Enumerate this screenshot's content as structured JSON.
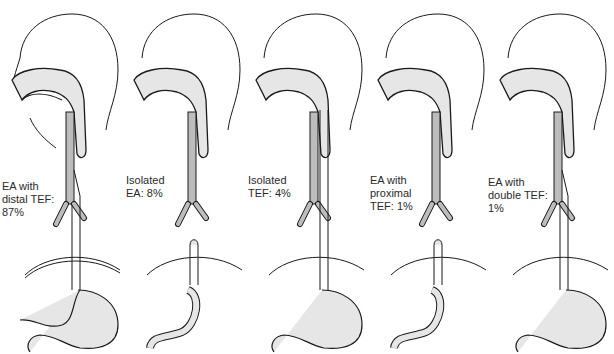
{
  "figure": {
    "colors": {
      "outline": "#1a1a1a",
      "fill": "#e6e6e6",
      "trachea_fill": "#bdbdbd",
      "text": "#2a2a2a"
    },
    "panels": [
      {
        "id": "ea-distal-tef",
        "label": "EA with\ndistal TEF:\n87%",
        "upper_pouch": "blind",
        "lower_connection": "fistula-to-trachea",
        "stomach": "normal"
      },
      {
        "id": "isolated-ea",
        "label": "Isolated\nEA: 8%",
        "upper_pouch": "blind",
        "lower_connection": "none",
        "stomach": "small"
      },
      {
        "id": "isolated-tef",
        "label": "Isolated\nTEF: 4%",
        "upper_pouch": "continuous",
        "lower_connection": "h-type-fistula",
        "stomach": "normal"
      },
      {
        "id": "ea-proximal-tef",
        "label": "EA with\nproximal\nTEF: 1%",
        "upper_pouch": "fistula-to-trachea",
        "lower_connection": "none",
        "stomach": "small"
      },
      {
        "id": "ea-double-tef",
        "label": "EA with\ndouble TEF:\n1%",
        "upper_pouch": "fistula-to-trachea",
        "lower_connection": "fistula-to-trachea",
        "stomach": "normal"
      }
    ]
  }
}
